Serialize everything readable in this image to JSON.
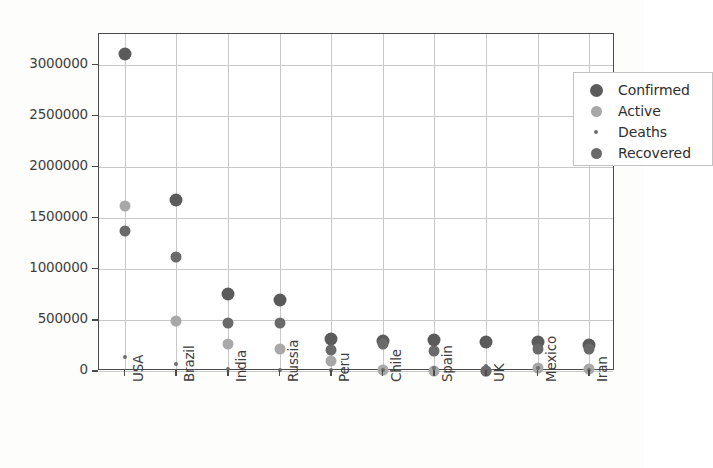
{
  "chart_data": {
    "type": "scatter",
    "title": "",
    "xlabel": "",
    "ylabel": "",
    "categories": [
      "USA",
      "Brazil",
      "India",
      "Russia",
      "Peru",
      "Chile",
      "Spain",
      "UK",
      "Mexico",
      "Iran"
    ],
    "ylim": [
      0,
      3300000
    ],
    "yticks": [
      0,
      500000,
      1000000,
      1500000,
      2000000,
      2500000,
      3000000
    ],
    "ytick_labels": [
      "0",
      "500000",
      "1000000",
      "1500000",
      "2000000",
      "2500000",
      "3000000"
    ],
    "grid": true,
    "legend_position": "upper right",
    "series": [
      {
        "name": "Confirmed",
        "color": "#5b5b5b",
        "marker_size": 13,
        "values": [
          3100000,
          1670000,
          750000,
          700000,
          316000,
          295000,
          300000,
          288000,
          282000,
          252000
        ]
      },
      {
        "name": "Active",
        "color": "#a8a8a8",
        "marker_size": 11,
        "values": [
          1620000,
          490000,
          265000,
          215000,
          100000,
          12000,
          0,
          0,
          32000,
          23000
        ]
      },
      {
        "name": "Deaths",
        "color": "#6e6e6e",
        "marker_size": 4,
        "values": [
          135000,
          66000,
          21000,
          10500,
          11300,
          6300,
          28400,
          44700,
          33500,
          12300
        ]
      },
      {
        "name": "Recovered",
        "color": "#6a6a6a",
        "marker_size": 11,
        "values": [
          1370000,
          1120000,
          470000,
          470000,
          207000,
          265000,
          196000,
          1400,
          220000,
          215000
        ]
      }
    ]
  },
  "legend": {
    "entries": [
      {
        "label": "Confirmed"
      },
      {
        "label": "Active"
      },
      {
        "label": "Deaths"
      },
      {
        "label": "Recovered"
      }
    ]
  }
}
